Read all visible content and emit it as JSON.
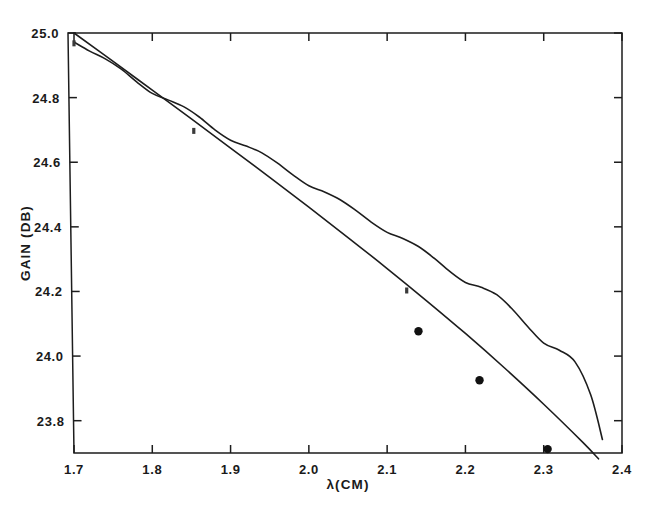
{
  "chart_data": {
    "type": "line",
    "title": "",
    "subtitle": "",
    "xlabel": "λ(CM)",
    "ylabel": "GAIN (DB)",
    "xlim": [
      1.7,
      2.4
    ],
    "ylim": [
      23.7,
      25.0
    ],
    "grid": false,
    "legend": null,
    "x_ticks": [
      1.7,
      1.8,
      1.9,
      2.0,
      2.1,
      2.2,
      2.3,
      2.4
    ],
    "x_tick_labels": [
      "1.7",
      "1.8",
      "1.9",
      "2.0",
      "2.1",
      "2.2",
      "2.3",
      "2.4"
    ],
    "y_ticks": [
      23.8,
      24.0,
      24.2,
      24.4,
      24.6,
      24.8,
      25.0
    ],
    "y_tick_labels": [
      "23.8",
      "24.0",
      "24.2",
      "24.4",
      "24.6",
      "24.8",
      "25.0"
    ],
    "series": [
      {
        "name": "smooth-theory-curve",
        "style": "solid-smooth",
        "x": [
          1.7,
          1.75,
          1.8,
          1.85,
          1.9,
          1.95,
          2.0,
          2.05,
          2.1,
          2.15,
          2.2,
          2.25,
          2.3,
          2.35,
          2.37
        ],
        "y": [
          25.0,
          24.912,
          24.823,
          24.734,
          24.644,
          24.553,
          24.461,
          24.367,
          24.271,
          24.172,
          24.07,
          23.963,
          23.851,
          23.733,
          23.682
        ]
      },
      {
        "name": "oscillating-measured-curve",
        "style": "solid-rippled",
        "x": [
          1.7,
          1.72,
          1.74,
          1.76,
          1.78,
          1.8,
          1.82,
          1.84,
          1.86,
          1.88,
          1.9,
          1.92,
          1.94,
          1.96,
          1.98,
          2.0,
          2.02,
          2.04,
          2.06,
          2.08,
          2.1,
          2.12,
          2.14,
          2.16,
          2.18,
          2.2,
          2.22,
          2.24,
          2.26,
          2.28,
          2.3,
          2.32,
          2.34,
          2.36,
          2.375
        ],
        "y": [
          24.972,
          24.944,
          24.92,
          24.889,
          24.849,
          24.813,
          24.793,
          24.772,
          24.74,
          24.7,
          24.668,
          24.65,
          24.629,
          24.597,
          24.56,
          24.527,
          24.508,
          24.484,
          24.451,
          24.414,
          24.383,
          24.364,
          24.339,
          24.303,
          24.262,
          24.228,
          24.213,
          24.19,
          24.145,
          24.09,
          24.04,
          24.018,
          23.982,
          23.88,
          23.742
        ]
      }
    ],
    "scatter_points": {
      "name": "experimental-data-points",
      "marker": "filled-circle",
      "x": [
        2.14,
        2.218,
        2.305
      ],
      "y": [
        24.077,
        23.925,
        23.712
      ]
    },
    "curve_annotations": {
      "name": "small-tick-markers",
      "marker": "small-dash",
      "x": [
        1.7,
        1.853,
        2.125
      ],
      "y": [
        24.968,
        24.697,
        24.203
      ]
    },
    "colors": {
      "ink": "#1d1d1d",
      "background": "#ffffff",
      "datapoint": "#111111"
    }
  }
}
